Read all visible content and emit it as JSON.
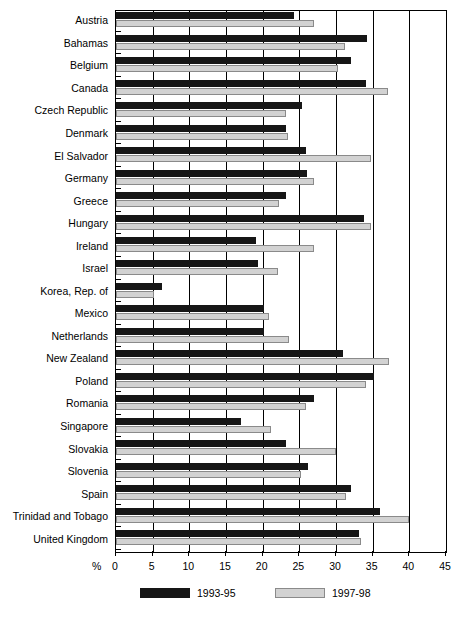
{
  "chart_data": {
    "type": "bar",
    "orientation": "horizontal",
    "title": "",
    "xlabel": "%",
    "ylabel": "",
    "xlim": [
      0,
      45
    ],
    "xticks": [
      0,
      5,
      10,
      15,
      20,
      25,
      30,
      35,
      40,
      45
    ],
    "grid": true,
    "legend_position": "bottom",
    "categories": [
      "Austria",
      "Bahamas",
      "Belgium",
      "Canada",
      "Czech Republic",
      "Denmark",
      "El Salvador",
      "Germany",
      "Greece",
      "Hungary",
      "Ireland",
      "Israel",
      "Korea, Rep. of",
      "Mexico",
      "Netherlands",
      "New Zealand",
      "Poland",
      "Romania",
      "Singapore",
      "Slovakia",
      "Slovenia",
      "Spain",
      "Trinidad and Tobago",
      "United Kingdom"
    ],
    "series": [
      {
        "name": "1993-95",
        "color": "#161616",
        "values": [
          24.3,
          34.2,
          32.0,
          34.1,
          25.4,
          23.2,
          25.9,
          26.1,
          23.2,
          33.8,
          19.1,
          19.4,
          6.3,
          20.2,
          20.2,
          31.0,
          35.2,
          27.0,
          17.1,
          23.2,
          26.2,
          32.0,
          36.0,
          33.1
        ]
      },
      {
        "name": "1997-98",
        "color": "#d2d2d2",
        "values": [
          27.0,
          31.2,
          30.3,
          37.1,
          23.2,
          23.5,
          34.8,
          27.0,
          22.2,
          34.8,
          27.0,
          22.1,
          5.2,
          20.9,
          23.6,
          37.2,
          34.1,
          25.9,
          21.1,
          30.0,
          25.2,
          31.4,
          40.0,
          33.4
        ]
      }
    ]
  },
  "axis": {
    "percent_symbol": "%"
  }
}
